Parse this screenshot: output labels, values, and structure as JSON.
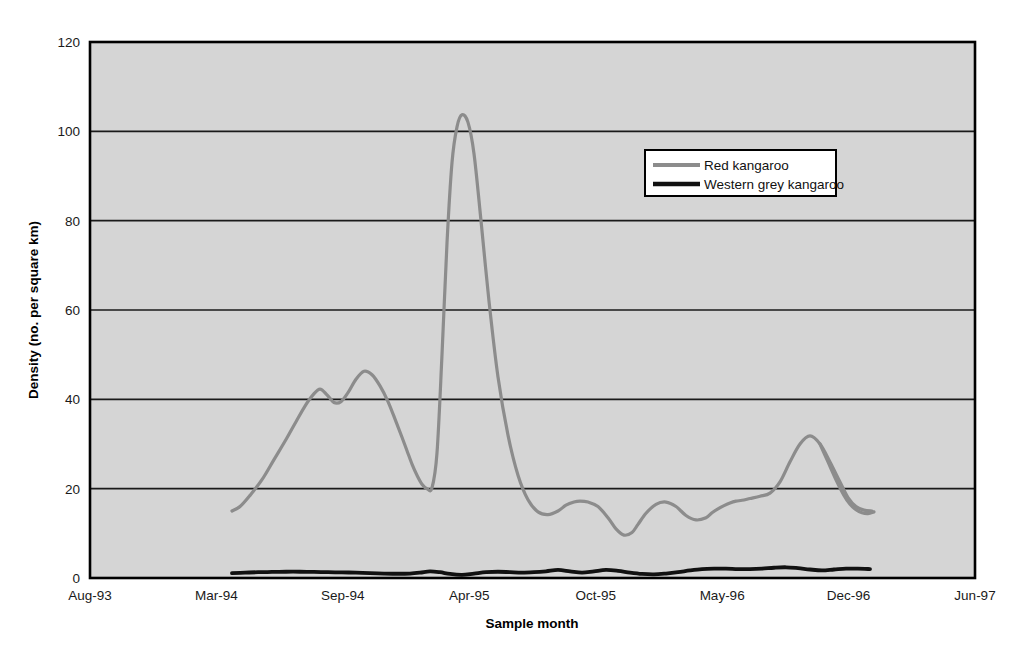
{
  "chart_data": {
    "type": "line",
    "title": "",
    "xlabel": "Sample month",
    "ylabel": "Density (no. per square km)",
    "ylim": [
      0,
      120
    ],
    "yticks": [
      0,
      20,
      40,
      60,
      80,
      100,
      120
    ],
    "ytick_labels": [
      "0",
      "20",
      "40",
      "60",
      "80",
      "100",
      "120"
    ],
    "xtick_labels": [
      "Aug-93",
      "Mar-94",
      "Sep-94",
      "Apr-95",
      "Oct-95",
      "May-96",
      "Dec-96",
      "Jun-97"
    ],
    "grid": "horizontal",
    "legend_position": "upper-right-inside",
    "plot_background": "#d5d5d5",
    "series": [
      {
        "name": "Red kangaroo",
        "color": "#8c8c8c",
        "line_width": 3.2,
        "x": [
          232,
          240,
          250,
          262,
          274,
          286,
          296,
          305,
          313,
          320,
          327,
          334,
          341,
          348,
          356,
          364,
          372,
          380,
          388,
          396,
          402,
          407,
          412,
          417,
          422,
          427,
          432,
          437,
          442,
          447,
          452,
          457,
          462,
          468,
          474,
          481,
          489,
          498,
          508,
          518,
          528,
          538,
          548,
          558,
          566,
          574,
          580,
          588,
          598,
          608,
          616,
          624,
          632,
          638,
          646,
          656,
          666,
          676,
          686,
          696,
          706,
          712,
          718,
          724,
          730,
          736,
          742,
          750,
          760,
          770,
          780,
          790,
          800,
          810,
          820,
          830,
          840,
          848,
          856,
          864,
          872
        ],
        "y": [
          15.0,
          16.0,
          18.5,
          22.0,
          26.5,
          31.0,
          35.0,
          38.5,
          41.0,
          42.3,
          41.0,
          39.3,
          39.5,
          41.5,
          44.5,
          46.3,
          45.5,
          43.0,
          39.5,
          35.0,
          31.5,
          28.5,
          25.5,
          23.0,
          21.0,
          20.0,
          20.2,
          28.0,
          50.0,
          75.0,
          93.0,
          101.0,
          103.7,
          102.0,
          95.0,
          80.0,
          62.0,
          45.0,
          32.0,
          23.0,
          17.5,
          14.8,
          14.2,
          15.0,
          16.3,
          17.0,
          17.2,
          17.0,
          16.0,
          13.5,
          11.0,
          9.6,
          10.2,
          12.0,
          14.5,
          16.5,
          17.0,
          16.0,
          14.0,
          13.0,
          13.5,
          14.6,
          15.5,
          16.2,
          16.8,
          17.2,
          17.4,
          17.8,
          18.3,
          19.0,
          21.5,
          26.0,
          30.0,
          31.8,
          30.0,
          26.0,
          21.5,
          18.0,
          16.0,
          15.2,
          15.0
        ]
      },
      {
        "name": "Red kangaroo-tail",
        "color": "#8c8c8c",
        "line_width": 3.2,
        "x": [
          820,
          828,
          836,
          844,
          850,
          856,
          862,
          868,
          874
        ],
        "y": [
          30.0,
          26.0,
          22.0,
          18.5,
          16.5,
          15.3,
          14.6,
          14.4,
          14.8
        ]
      },
      {
        "name": "Western grey kangaroo",
        "color": "#111111",
        "line_width": 3.8,
        "x": [
          232,
          245,
          258,
          272,
          286,
          300,
          314,
          328,
          342,
          356,
          370,
          384,
          398,
          410,
          420,
          430,
          440,
          450,
          462,
          474,
          486,
          498,
          510,
          522,
          534,
          546,
          558,
          570,
          582,
          594,
          606,
          618,
          630,
          642,
          654,
          666,
          678,
          690,
          702,
          714,
          726,
          738,
          750,
          762,
          774,
          786,
          798,
          810,
          822,
          834,
          846,
          858,
          870
        ],
        "y": [
          1.1,
          1.2,
          1.3,
          1.35,
          1.4,
          1.4,
          1.35,
          1.3,
          1.25,
          1.2,
          1.1,
          1.0,
          0.95,
          1.0,
          1.2,
          1.5,
          1.3,
          0.9,
          0.7,
          1.0,
          1.3,
          1.4,
          1.3,
          1.2,
          1.3,
          1.5,
          1.8,
          1.5,
          1.2,
          1.5,
          1.8,
          1.6,
          1.2,
          0.9,
          0.8,
          1.0,
          1.3,
          1.7,
          2.0,
          2.1,
          2.1,
          2.0,
          2.0,
          2.1,
          2.3,
          2.4,
          2.2,
          1.9,
          1.7,
          1.9,
          2.1,
          2.1,
          2.0
        ]
      }
    ]
  },
  "legend": {
    "items": [
      {
        "label": "Red kangaroo",
        "color": "#8c8c8c"
      },
      {
        "label": "Western grey kangaroo",
        "color": "#111111"
      }
    ]
  },
  "axes": {
    "y_title": "Density (no. per square km)",
    "x_title": "Sample month",
    "y_labels": [
      "120",
      "100",
      "80",
      "60",
      "40",
      "20",
      "0"
    ],
    "x_labels": [
      "Aug-93",
      "Mar-94",
      "Sep-94",
      "Apr-95",
      "Oct-95",
      "May-96",
      "Dec-96",
      "Jun-97"
    ]
  }
}
